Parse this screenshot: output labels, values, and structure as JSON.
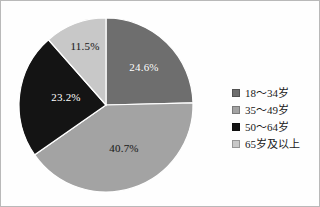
{
  "chart_data": {
    "type": "pie",
    "title": "",
    "subtitle": "",
    "xlabel": "",
    "ylabel": "",
    "grid": false,
    "legend_position": "right",
    "start_angle_deg": 0,
    "direction": "clockwise",
    "categories": [
      "18～34岁",
      "35～49岁",
      "50～64岁",
      "65岁及以上"
    ],
    "values": [
      24.6,
      40.7,
      23.2,
      11.5
    ],
    "value_labels": [
      "24.6%",
      "40.7%",
      "23.2%",
      "11.5%"
    ],
    "colors": [
      "#6e6e6e",
      "#a3a3a3",
      "#141414",
      "#c8c8c8"
    ],
    "label_text_colors": [
      "#ffffff",
      "#1c1c1c",
      "#ffffff",
      "#1c1c1c"
    ],
    "units": "percent"
  },
  "pie": {
    "center_x": 105,
    "center_y": 104,
    "radius": 87,
    "slices": [
      {
        "name": "18-34",
        "label": "24.6%",
        "value": 24.6,
        "color": "#6e6e6e",
        "label_x": 143,
        "label_y": 66,
        "label_tone": "on-dark"
      },
      {
        "name": "35-49",
        "label": "40.7%",
        "value": 40.7,
        "color": "#a3a3a3",
        "label_x": 123,
        "label_y": 147,
        "label_tone": "on-light"
      },
      {
        "name": "50-64",
        "label": "23.2%",
        "value": 23.2,
        "color": "#141414",
        "label_x": 65,
        "label_y": 96,
        "label_tone": "on-dark"
      },
      {
        "name": "65-plus",
        "label": "11.5%",
        "value": 11.5,
        "color": "#c8c8c8",
        "label_x": 84,
        "label_y": 45,
        "label_tone": "on-light"
      }
    ]
  },
  "legend": {
    "items": [
      {
        "label": "18～34岁",
        "color": "#6e6e6e"
      },
      {
        "label": "35～49岁",
        "color": "#a3a3a3"
      },
      {
        "label": "50～64岁",
        "color": "#141414"
      },
      {
        "label": "65岁及以上",
        "color": "#c8c8c8"
      }
    ]
  }
}
